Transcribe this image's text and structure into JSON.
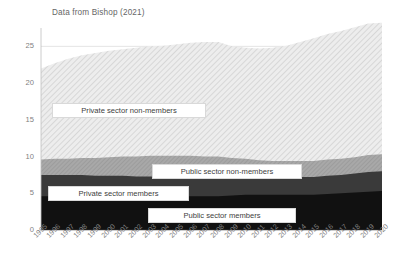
{
  "chart": {
    "title": "Data from Bishop (2021)"
  },
  "chart_data": {
    "type": "area",
    "stacked": true,
    "title": "Data from Bishop (2021)",
    "xlabel": "",
    "ylabel": "",
    "ylim": [
      0,
      27.5
    ],
    "yticks": [
      0,
      5,
      10,
      15,
      20,
      25
    ],
    "ytick_labels": [
      "0",
      "5",
      "10",
      "15",
      "20",
      "25"
    ],
    "grid": true,
    "legend_position": "inline-labels",
    "categories": [
      "1995",
      "1996",
      "1997",
      "1998",
      "1999",
      "2000",
      "2001",
      "2002",
      "2003",
      "2004",
      "2005",
      "2006",
      "2007",
      "2008",
      "2009",
      "2010",
      "2011",
      "2012",
      "2013",
      "2014",
      "2015",
      "2016",
      "2017",
      "2018",
      "2019",
      "2020"
    ],
    "series": [
      {
        "name": "Public sector members",
        "fill": "#111111",
        "values": [
          4.6,
          4.6,
          4.6,
          4.6,
          4.6,
          4.6,
          4.6,
          4.6,
          4.6,
          4.6,
          4.6,
          4.6,
          4.6,
          4.6,
          4.7,
          4.8,
          4.8,
          4.8,
          4.8,
          4.8,
          4.8,
          4.9,
          5.0,
          5.1,
          5.2,
          5.3
        ]
      },
      {
        "name": "Private sector members",
        "fill": "#3a3a3a",
        "values": [
          2.9,
          2.9,
          2.9,
          2.9,
          2.8,
          2.8,
          2.8,
          2.7,
          2.7,
          2.6,
          2.5,
          2.5,
          2.4,
          2.4,
          2.3,
          2.3,
          2.3,
          2.3,
          2.4,
          2.4,
          2.4,
          2.5,
          2.5,
          2.6,
          2.7,
          2.7
        ]
      },
      {
        "name": "Public sector non-members",
        "fill": "#a6a6a6",
        "values": [
          2.1,
          2.2,
          2.2,
          2.3,
          2.4,
          2.5,
          2.6,
          2.7,
          2.8,
          2.9,
          3.0,
          3.0,
          3.0,
          3.0,
          2.8,
          2.6,
          2.4,
          2.3,
          2.2,
          2.2,
          2.2,
          2.2,
          2.2,
          2.2,
          2.3,
          2.3
        ]
      },
      {
        "name": "Private sector non-members",
        "fill": "#e6e6e6",
        "values": [
          12.4,
          13.0,
          13.6,
          14.0,
          14.3,
          14.5,
          14.6,
          14.8,
          14.9,
          15.0,
          15.2,
          15.4,
          15.6,
          15.6,
          15.2,
          15.1,
          15.2,
          15.4,
          15.7,
          16.2,
          16.7,
          17.1,
          17.4,
          17.7,
          17.9,
          17.9
        ]
      }
    ],
    "totals": [
      22.0,
      22.7,
      23.3,
      23.8,
      24.1,
      24.4,
      24.6,
      24.8,
      25.0,
      25.1,
      25.3,
      25.4,
      25.6,
      25.6,
      25.0,
      24.8,
      24.7,
      24.8,
      25.1,
      25.6,
      26.1,
      26.7,
      27.1,
      27.6,
      28.1,
      28.2
    ],
    "series_labels": [
      {
        "text": "Private sector non-members"
      },
      {
        "text": "Public sector non-members"
      },
      {
        "text": "Private sector members"
      },
      {
        "text": "Public sector members"
      }
    ],
    "colors": {
      "public_members": "#111111",
      "private_members": "#3a3a3a",
      "public_non_members": "#a6a6a6",
      "private_non_members": "#e6e6e6",
      "gridline": "#d9d9d9",
      "axis_text": "#7f7f7f"
    }
  }
}
